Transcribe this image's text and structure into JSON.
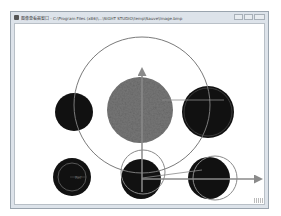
{
  "window": {
    "title": "图像查看器窗口 - C:\\Program Files (x86)\\...\\SIGHT STUDIO\\temp\\Sauve\\Image.bmp",
    "controls": [
      "minimize",
      "maximize",
      "close"
    ]
  },
  "canvas": {
    "description": "Image view showing circle-fitting overlay: dark filled circles, a gray textured central circle, a large outline circle, fitted outline circles, and X/Y coordinate axis arrows.",
    "colors": {
      "dark_circle": "#111111",
      "textured_circle": "#6b6b6b",
      "overlay_line": "#7a7a7a",
      "axis": "#8a8a8a",
      "background": "#ffffff"
    },
    "inner_label": "Ref"
  }
}
